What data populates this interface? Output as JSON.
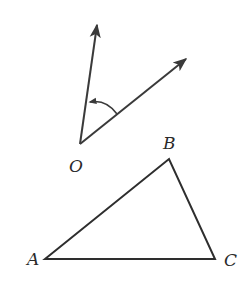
{
  "figure": {
    "angle_diagram": {
      "vertex_label": "O",
      "vertex": [
        80,
        144
      ],
      "ray1_tip": [
        98,
        22
      ],
      "ray2_tip": [
        189,
        57
      ],
      "arc_direction": "counterclockwise"
    },
    "triangle": {
      "vertices": [
        {
          "label": "A",
          "point": [
            45,
            259
          ]
        },
        {
          "label": "B",
          "point": [
            169,
            159
          ]
        },
        {
          "label": "C",
          "point": [
            215,
            259
          ]
        }
      ]
    },
    "colors": {
      "stroke": "#3a3a3a",
      "background": "#ffffff"
    }
  }
}
